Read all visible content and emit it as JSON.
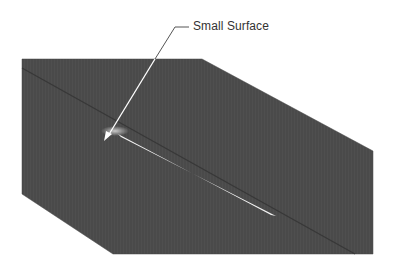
{
  "figure": {
    "type": "cad-surface-render",
    "background_color": "#ffffff",
    "surface": {
      "fill_color": "#4a4a4a",
      "outline_points": "22,59 202,59 373,151 373,254 113,254 22,194",
      "seam_line": {
        "x1": 22,
        "y1": 68,
        "x2": 355,
        "y2": 254,
        "color": "#333333"
      },
      "sliver": {
        "points": "118,134 121,137 276,216 271,215",
        "color": "#f2f2f2"
      },
      "small_surface_glow": {
        "cx": 115,
        "cy": 131,
        "rx": 14,
        "ry": 5,
        "color": "#bdbdbd"
      }
    },
    "callout": {
      "label": "Small Surface",
      "label_color": "#333333",
      "line_color": "#ffffff",
      "leader_color": "#555555",
      "leader_h": {
        "x1": 175,
        "y1": 27,
        "x2": 189,
        "y2": 27
      },
      "leader_diag_above": {
        "x1": 175,
        "y1": 27,
        "x2": 155,
        "y2": 59
      },
      "arrow_line": {
        "x1": 155,
        "y1": 59,
        "x2": 108,
        "y2": 136
      },
      "arrow_head": "104,141 106,131 112,134"
    }
  }
}
